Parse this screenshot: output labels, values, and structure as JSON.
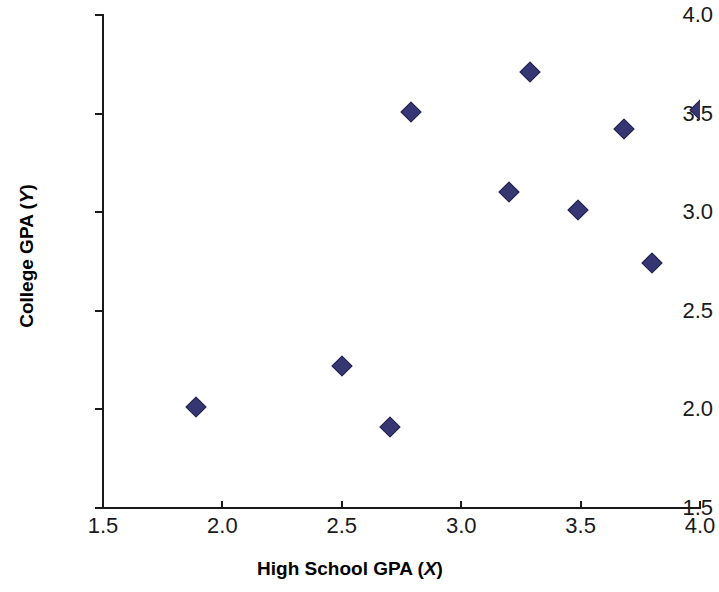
{
  "chart_data": {
    "type": "scatter",
    "title": "",
    "xlabel": "High School GPA (X)",
    "ylabel": "College GPA (Y)",
    "xlabel_text": "High School GPA (",
    "xlabel_var": "X",
    "xlabel_tail": ")",
    "ylabel_text": "College GPA (",
    "ylabel_var": "Y",
    "ylabel_tail": ")",
    "xlim": [
      1.5,
      4.0
    ],
    "ylim": [
      1.5,
      4.0
    ],
    "xticks": [
      1.5,
      2.0,
      2.5,
      3.0,
      3.5,
      4.0
    ],
    "yticks": [
      1.5,
      2.0,
      2.5,
      3.0,
      3.5,
      4.0
    ],
    "xtick_labels": [
      "1.5",
      "2.0",
      "2.5",
      "3.0",
      "3.5",
      "4.0"
    ],
    "ytick_labels": [
      "1.5",
      "2.0",
      "2.5",
      "3.0",
      "3.5",
      "4.0"
    ],
    "grid": false,
    "legend": false,
    "marker_shape": "diamond",
    "marker_color": "#363672",
    "marker_edge_color": "#23234f",
    "x": [
      1.89,
      2.5,
      2.7,
      2.79,
      3.2,
      3.29,
      3.49,
      3.68,
      3.8,
      4.0
    ],
    "y": [
      2.01,
      2.22,
      1.91,
      3.51,
      3.1,
      3.71,
      3.01,
      3.42,
      2.74,
      3.52
    ],
    "points": [
      {
        "x": 1.89,
        "y": 2.01
      },
      {
        "x": 2.5,
        "y": 2.22
      },
      {
        "x": 2.7,
        "y": 1.91
      },
      {
        "x": 2.79,
        "y": 3.51
      },
      {
        "x": 3.2,
        "y": 3.1
      },
      {
        "x": 3.29,
        "y": 3.71
      },
      {
        "x": 3.49,
        "y": 3.01
      },
      {
        "x": 3.68,
        "y": 3.42
      },
      {
        "x": 3.8,
        "y": 2.74
      },
      {
        "x": 4.0,
        "y": 3.52
      }
    ]
  }
}
